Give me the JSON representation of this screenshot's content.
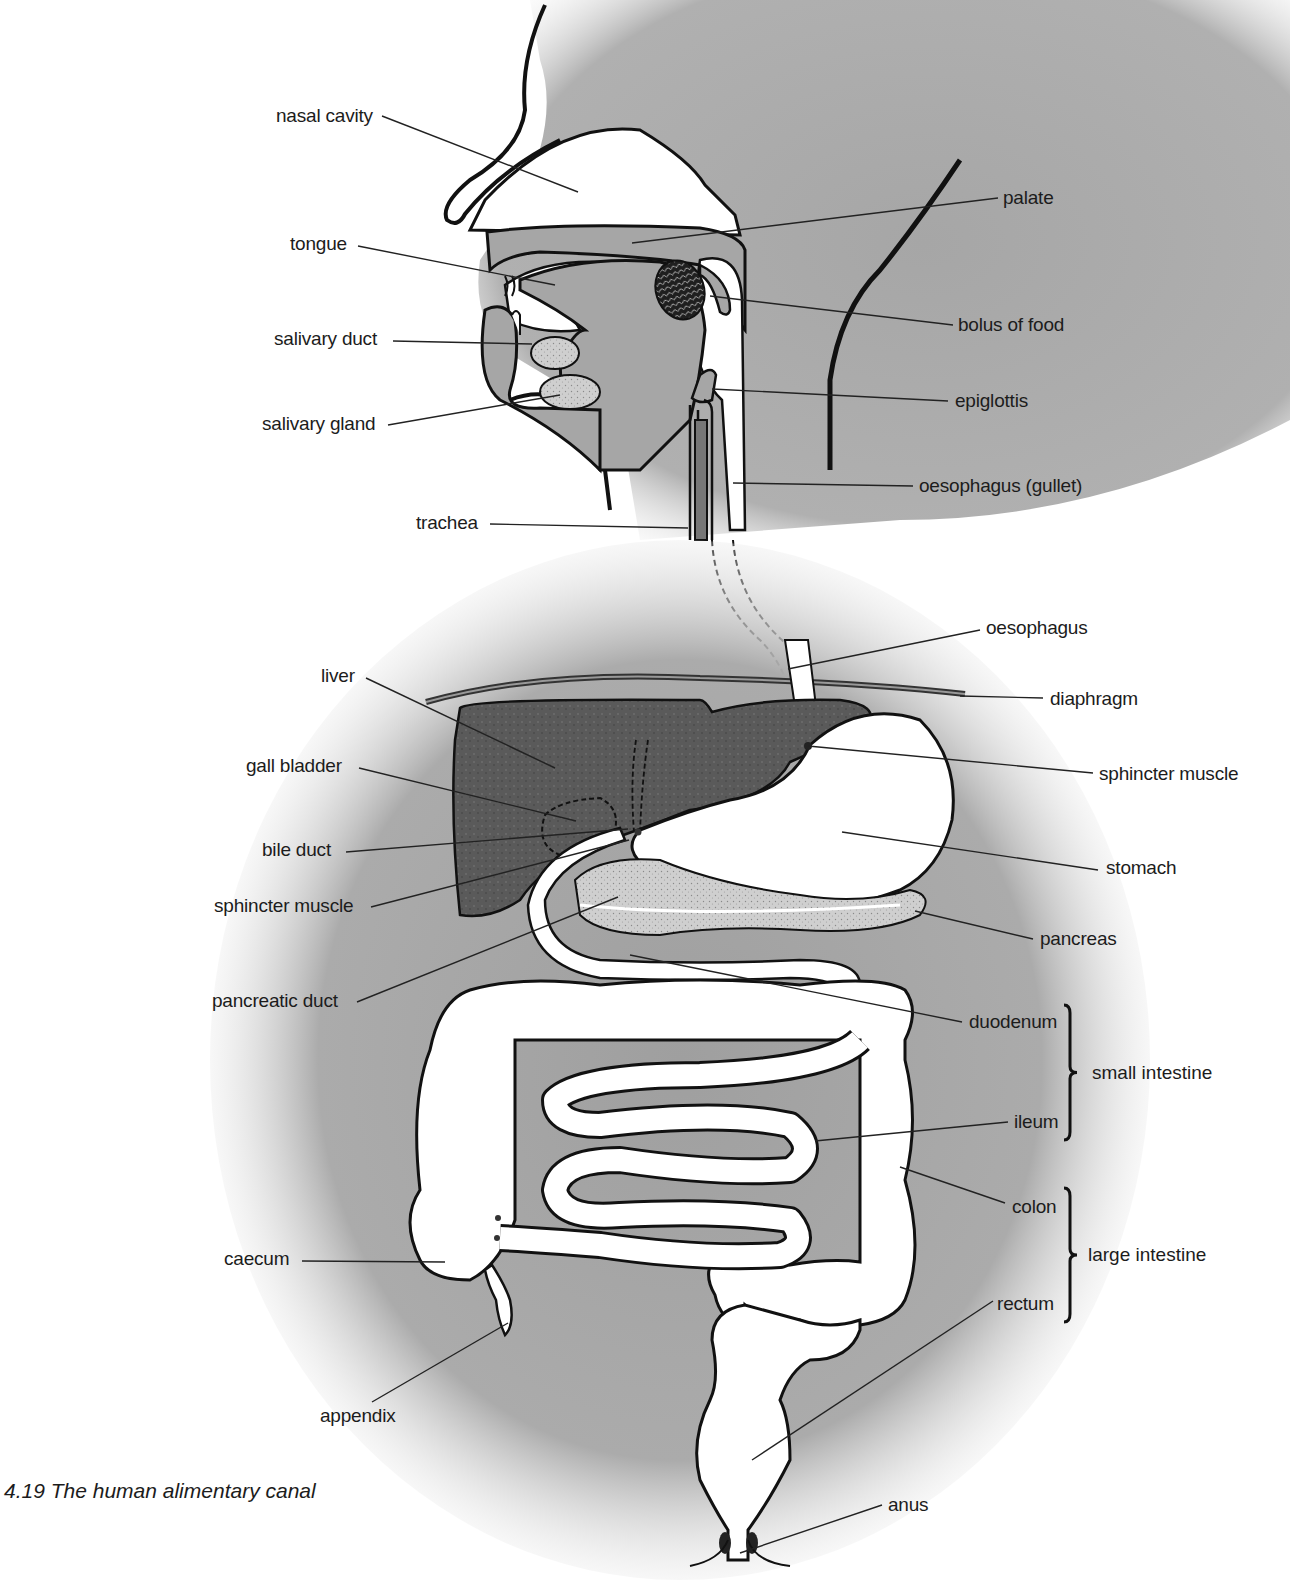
{
  "figure": {
    "caption": "4.19  The human alimentary canal",
    "colors": {
      "background": "#ffffff",
      "body_fill": "#a9a9a9",
      "organ_outline": "#111111",
      "liver_fill": "#5e5e5e",
      "pancreas_fill": "#c9c9c9",
      "lumen_fill": "#ffffff",
      "bolus_fill": "#2a2a2a",
      "leader_line": "#222222"
    }
  },
  "labels": [
    {
      "id": "nasal-cavity",
      "text": "nasal cavity",
      "x": 276,
      "y": 105,
      "anchor": "left",
      "line": [
        382,
        116,
        578,
        192
      ]
    },
    {
      "id": "palate",
      "text": "palate",
      "x": 1003,
      "y": 187,
      "anchor": "left",
      "line": [
        998,
        198,
        632,
        243
      ]
    },
    {
      "id": "tongue",
      "text": "tongue",
      "x": 290,
      "y": 233,
      "anchor": "left",
      "line": [
        358,
        246,
        555,
        285
      ]
    },
    {
      "id": "bolus-of-food",
      "text": "bolus of food",
      "x": 958,
      "y": 314,
      "anchor": "left",
      "line": [
        953,
        325,
        710,
        296
      ]
    },
    {
      "id": "salivary-duct",
      "text": "salivary duct",
      "x": 274,
      "y": 328,
      "anchor": "left",
      "line": [
        393,
        341,
        532,
        344
      ]
    },
    {
      "id": "epiglottis",
      "text": "epiglottis",
      "x": 955,
      "y": 390,
      "anchor": "left",
      "line": [
        948,
        401,
        712,
        389
      ]
    },
    {
      "id": "salivary-gland",
      "text": "salivary gland",
      "x": 262,
      "y": 413,
      "anchor": "left",
      "line": [
        388,
        425,
        560,
        395
      ]
    },
    {
      "id": "oesophagus-gullet",
      "text": "oesophagus (gullet)",
      "x": 919,
      "y": 475,
      "anchor": "left",
      "line": [
        913,
        486,
        733,
        483
      ]
    },
    {
      "id": "trachea",
      "text": "trachea",
      "x": 416,
      "y": 512,
      "anchor": "left",
      "line": [
        490,
        524,
        688,
        528
      ]
    },
    {
      "id": "oesophagus",
      "text": "oesophagus",
      "x": 986,
      "y": 617,
      "anchor": "left",
      "line": [
        980,
        630,
        788,
        669
      ]
    },
    {
      "id": "liver",
      "text": "liver",
      "x": 321,
      "y": 665,
      "anchor": "left",
      "line": [
        366,
        678,
        555,
        768
      ]
    },
    {
      "id": "diaphragm",
      "text": "diaphragm",
      "x": 1050,
      "y": 688,
      "anchor": "left",
      "line": [
        1043,
        698,
        960,
        696
      ]
    },
    {
      "id": "gall-bladder",
      "text": "gall bladder",
      "x": 246,
      "y": 755,
      "anchor": "left",
      "line": [
        359,
        768,
        576,
        821
      ]
    },
    {
      "id": "sphincter-muscle-upper",
      "text": "sphincter muscle",
      "x": 1099,
      "y": 763,
      "anchor": "left",
      "line": [
        1093,
        773,
        808,
        746
      ]
    },
    {
      "id": "bile-duct",
      "text": "bile duct",
      "x": 262,
      "y": 839,
      "anchor": "left",
      "line": [
        346,
        852,
        628,
        829
      ]
    },
    {
      "id": "stomach",
      "text": "stomach",
      "x": 1106,
      "y": 857,
      "anchor": "left",
      "line": [
        1098,
        870,
        842,
        832
      ]
    },
    {
      "id": "sphincter-muscle-lower",
      "text": "sphincter muscle",
      "x": 214,
      "y": 895,
      "anchor": "left",
      "line": [
        371,
        907,
        629,
        840
      ]
    },
    {
      "id": "pancreas",
      "text": "pancreas",
      "x": 1040,
      "y": 928,
      "anchor": "left",
      "line": [
        1033,
        939,
        915,
        911
      ]
    },
    {
      "id": "pancreatic-duct",
      "text": "pancreatic duct",
      "x": 212,
      "y": 990,
      "anchor": "left",
      "line": [
        357,
        1002,
        618,
        897
      ]
    },
    {
      "id": "duodenum",
      "text": "duodenum",
      "x": 969,
      "y": 1011,
      "anchor": "left",
      "line": [
        962,
        1022,
        630,
        955
      ]
    },
    {
      "id": "ileum",
      "text": "ileum",
      "x": 1014,
      "y": 1111,
      "anchor": "left",
      "line": [
        1008,
        1122,
        815,
        1141
      ]
    },
    {
      "id": "colon",
      "text": "colon",
      "x": 1012,
      "y": 1196,
      "anchor": "left",
      "line": [
        1005,
        1203,
        900,
        1167
      ]
    },
    {
      "id": "caecum",
      "text": "caecum",
      "x": 224,
      "y": 1248,
      "anchor": "left",
      "line": [
        302,
        1261,
        445,
        1262
      ]
    },
    {
      "id": "rectum",
      "text": "rectum",
      "x": 997,
      "y": 1293,
      "anchor": "left",
      "line": [
        993,
        1301,
        752,
        1460
      ]
    },
    {
      "id": "appendix",
      "text": "appendix",
      "x": 320,
      "y": 1405,
      "anchor": "left",
      "line": [
        372,
        1402,
        508,
        1323
      ]
    },
    {
      "id": "anus",
      "text": "anus",
      "x": 888,
      "y": 1494,
      "anchor": "left",
      "line": [
        882,
        1505,
        740,
        1553
      ]
    }
  ],
  "groups": [
    {
      "id": "small-intestine",
      "text": "small intestine",
      "bracket_x": 1068,
      "top": 1005,
      "bottom": 1140,
      "label_x": 1092,
      "label_y": 1062
    },
    {
      "id": "large-intestine",
      "text": "large intestine",
      "bracket_x": 1068,
      "top": 1188,
      "bottom": 1322,
      "label_x": 1088,
      "label_y": 1244
    }
  ]
}
